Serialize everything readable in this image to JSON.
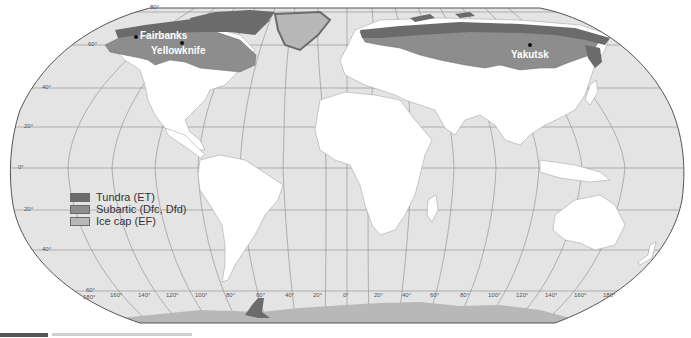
{
  "map": {
    "title": "World distribution of tundra, subarctic and ice cap climates",
    "projection": "Robinson-like world projection",
    "colors": {
      "ocean": "#e4e4e4",
      "land": "#ffffff",
      "country_border": "#9a9a9a",
      "graticule": "#8a8a8a",
      "outline": "#555555",
      "tundra": "#6b6b6b",
      "subarctic": "#8d8d8d",
      "ice_cap": "#b8b8b8",
      "inland_water": "#cfcfcf"
    },
    "legend": {
      "items": [
        {
          "label": "Tundra (ET)",
          "color": "#6b6b6b"
        },
        {
          "label": "Subartic (Dfc, Dfd)",
          "color": "#8d8d8d"
        },
        {
          "label": "Ice cap (EF)",
          "color": "#b8b8b8"
        }
      ]
    },
    "latitude_labels": [
      {
        "text": "80°",
        "x": 150,
        "y": 7
      },
      {
        "text": "60°",
        "x": 88,
        "y": 43
      },
      {
        "text": "40°",
        "x": 42,
        "y": 85
      },
      {
        "text": "20°",
        "x": 24,
        "y": 124
      },
      {
        "text": "0°",
        "x": 18,
        "y": 165
      },
      {
        "text": "20°",
        "x": 24,
        "y": 207
      },
      {
        "text": "40°",
        "x": 42,
        "y": 248
      },
      {
        "text": "60°",
        "x": 86,
        "y": 289
      }
    ],
    "longitude_labels": [
      {
        "text": "180°",
        "x": 83,
        "y": 294
      },
      {
        "text": "160°",
        "x": 110,
        "y": 292
      },
      {
        "text": "140°",
        "x": 138,
        "y": 292
      },
      {
        "text": "120°",
        "x": 166,
        "y": 292
      },
      {
        "text": "100°",
        "x": 195,
        "y": 292
      },
      {
        "text": "80°",
        "x": 226,
        "y": 292
      },
      {
        "text": "60°",
        "x": 256,
        "y": 292
      },
      {
        "text": "40°",
        "x": 285,
        "y": 292
      },
      {
        "text": "20°",
        "x": 313,
        "y": 292
      },
      {
        "text": "0°",
        "x": 343,
        "y": 292
      },
      {
        "text": "20°",
        "x": 374,
        "y": 292
      },
      {
        "text": "40°",
        "x": 402,
        "y": 292
      },
      {
        "text": "60°",
        "x": 430,
        "y": 292
      },
      {
        "text": "80°",
        "x": 460,
        "y": 292
      },
      {
        "text": "100°",
        "x": 488,
        "y": 292
      },
      {
        "text": "120°",
        "x": 516,
        "y": 292
      },
      {
        "text": "140°",
        "x": 545,
        "y": 292
      },
      {
        "text": "160°",
        "x": 574,
        "y": 292
      },
      {
        "text": "180°",
        "x": 603,
        "y": 292
      }
    ],
    "cities": [
      {
        "name": "Fairbanks",
        "dot_x": 135,
        "dot_y": 36,
        "label_x": 140,
        "label_y": 30
      },
      {
        "name": "Yellowknife",
        "dot_x": 180,
        "dot_y": 42,
        "label_x": 151,
        "label_y": 45
      },
      {
        "name": "Yakutsk",
        "dot_x": 529,
        "dot_y": 44,
        "label_x": 511,
        "label_y": 49
      }
    ]
  }
}
